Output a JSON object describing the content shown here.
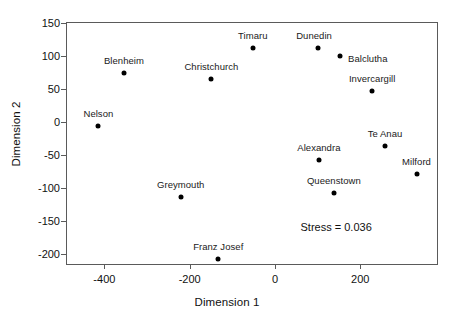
{
  "chart_data": {
    "type": "scatter",
    "title": "",
    "xlabel": "Dimension 1",
    "ylabel": "Dimension 2",
    "xlim": [
      -490,
      380
    ],
    "ylim": [
      -215,
      152
    ],
    "xticks": [
      -400,
      -200,
      0,
      200
    ],
    "yticks": [
      150,
      100,
      50,
      0,
      -50,
      -100,
      -150,
      -200
    ],
    "grid": false,
    "legend": null,
    "annotation": "Stress =  0.036",
    "points": [
      {
        "label": "Nelson",
        "x": -414,
        "y": -5,
        "label_dx": 0,
        "label_dy": -7
      },
      {
        "label": "Blenheim",
        "x": -354,
        "y": 74,
        "label_dx": 0,
        "label_dy": -7
      },
      {
        "label": "Christchurch",
        "x": -149,
        "y": 65,
        "label_dx": 0,
        "label_dy": -7
      },
      {
        "label": "Greymouth",
        "x": -221,
        "y": -113,
        "label_dx": 0,
        "label_dy": -7
      },
      {
        "label": "Franz Josef",
        "x": -133,
        "y": -207,
        "label_dx": 0,
        "label_dy": -7
      },
      {
        "label": "Timaru",
        "x": -52,
        "y": 112,
        "label_dx": 0,
        "label_dy": -7
      },
      {
        "label": "Dunedin",
        "x": 101,
        "y": 113,
        "label_dx": -4,
        "label_dy": -7
      },
      {
        "label": "Balclutha",
        "x": 152,
        "y": 101,
        "label_dx": 28,
        "label_dy": 2
      },
      {
        "label": "Invercargill",
        "x": 228,
        "y": 47,
        "label_dx": 0,
        "label_dy": -7
      },
      {
        "label": "Te Anau",
        "x": 258,
        "y": -36,
        "label_dx": 0,
        "label_dy": -7
      },
      {
        "label": "Milford",
        "x": 332,
        "y": -79,
        "label_dx": 0,
        "label_dy": -7
      },
      {
        "label": "Alexandra",
        "x": 103,
        "y": -57,
        "label_dx": 0,
        "label_dy": -7
      },
      {
        "label": "Queenstown",
        "x": 138,
        "y": -108,
        "label_dx": 0,
        "label_dy": -7
      }
    ]
  },
  "style": {
    "marker_color": "#000000",
    "axis_color": "#5a5a5a",
    "text_color": "#111111",
    "background": "#ffffff"
  }
}
